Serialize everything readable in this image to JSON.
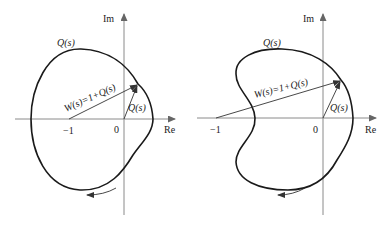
{
  "figure": {
    "panels": [
      {
        "id": "left",
        "shape": "convex",
        "axis_labels": {
          "real": "Re",
          "imag": "Im"
        },
        "tick_labels": {
          "minus_one": "−1",
          "origin": "0"
        },
        "curve_label": "Q(s)",
        "vector_labels": {
          "w": "W(s)=1+Q(s)",
          "q": "Q(s)"
        },
        "direction": "counterclockwise"
      },
      {
        "id": "right",
        "shape": "kidney",
        "axis_labels": {
          "real": "Re",
          "imag": "Im"
        },
        "tick_labels": {
          "minus_one": "−1",
          "origin": "0"
        },
        "curve_label": "Q(s)",
        "vector_labels": {
          "w": "W(s)=1+Q(s)",
          "q": "Q(s)"
        },
        "direction": "counterclockwise"
      }
    ]
  }
}
